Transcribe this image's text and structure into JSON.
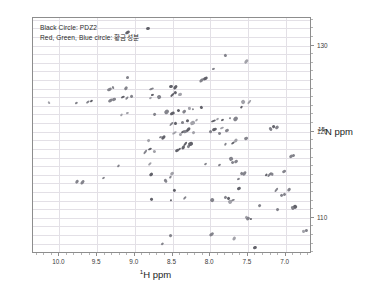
{
  "figure": {
    "width": 366,
    "height": 292,
    "background": "#ffffff",
    "frame_color": "#8d8d8d",
    "grid_color": "#e3e0e6",
    "peak_color": "#7a7a82"
  },
  "legend": {
    "line1": "Black Circle: PDZ2",
    "line2": "Red, Green, Blue circle: 황금성분"
  },
  "axes": {
    "x_title_sup": "1",
    "x_title_main": "H ppm",
    "y_title_sup": "15",
    "y_title_main": "N ppm",
    "x_ticks": [
      "10.0",
      "9.5",
      "9.0",
      "8.5",
      "8.0",
      "7.5",
      "7.0"
    ],
    "x_tick_values": [
      10.0,
      9.5,
      9.0,
      8.5,
      8.0,
      7.5,
      7.0
    ],
    "y_ticks": [
      "110",
      "120",
      "130"
    ],
    "y_tick_values": [
      110,
      120,
      130
    ]
  },
  "chart_data": {
    "type": "scatter",
    "title": "",
    "subtitle": "",
    "xlabel": "1H ppm",
    "ylabel": "15N ppm",
    "xlim": [
      10.35,
      6.65
    ],
    "ylim": [
      133.2,
      105.8
    ],
    "x_inverted": true,
    "y_inverted": true,
    "grid": true,
    "legend_position": "top-left",
    "annotations": [
      "Black Circle: PDZ2",
      "Red, Green, Blue circle: 황금성분"
    ],
    "series": [
      {
        "name": "PDZ2 HSQC cross-peaks",
        "color": "#7a7a82",
        "points": [
          [
            7.4,
            106.5
          ],
          [
            8.64,
            107.0
          ],
          [
            8.52,
            108.0
          ],
          [
            7.68,
            107.6
          ],
          [
            7.98,
            108.1
          ],
          [
            6.77,
            108.4
          ],
          [
            6.72,
            108.5
          ],
          [
            7.52,
            110.0
          ],
          [
            7.46,
            109.8
          ],
          [
            7.49,
            109.9
          ],
          [
            7.1,
            111.0
          ],
          [
            6.88,
            111.3
          ],
          [
            6.91,
            111.2
          ],
          [
            7.35,
            111.4
          ],
          [
            7.7,
            112.0
          ],
          [
            7.74,
            111.9
          ],
          [
            8.78,
            112.2
          ],
          [
            8.52,
            112.0
          ],
          [
            8.34,
            112.3
          ],
          [
            7.98,
            112.1
          ],
          [
            7.8,
            112.4
          ],
          [
            7.76,
            112.3
          ],
          [
            7.05,
            112.6
          ],
          [
            7.01,
            112.7
          ],
          [
            6.95,
            113.3
          ],
          [
            8.48,
            113.2
          ],
          [
            7.62,
            113.4
          ],
          [
            7.12,
            113.2
          ],
          [
            9.76,
            114.2
          ],
          [
            9.7,
            114.1
          ],
          [
            9.41,
            114.6
          ],
          [
            8.6,
            114.3
          ],
          [
            8.53,
            114.7
          ],
          [
            8.78,
            115.0
          ],
          [
            8.5,
            115.2
          ],
          [
            7.58,
            115.2
          ],
          [
            7.55,
            115.1
          ],
          [
            7.25,
            114.9
          ],
          [
            7.22,
            115.0
          ],
          [
            7.18,
            115.1
          ],
          [
            7.62,
            114.5
          ],
          [
            7.02,
            115.4
          ],
          [
            9.22,
            116.0
          ],
          [
            8.8,
            116.2
          ],
          [
            8.06,
            116.3
          ],
          [
            7.88,
            116.1
          ],
          [
            7.7,
            116.4
          ],
          [
            7.66,
            116.5
          ],
          [
            7.73,
            116.8
          ],
          [
            6.89,
            117.2
          ],
          [
            6.93,
            117.1
          ],
          [
            8.86,
            117.6
          ],
          [
            8.74,
            117.7
          ],
          [
            8.8,
            118.0
          ],
          [
            8.44,
            117.8
          ],
          [
            8.4,
            118.0
          ],
          [
            8.36,
            118.2
          ],
          [
            8.33,
            118.5
          ],
          [
            8.29,
            118.3
          ],
          [
            8.26,
            118.6
          ],
          [
            7.8,
            118.5
          ],
          [
            7.7,
            118.7
          ],
          [
            7.66,
            118.9
          ],
          [
            7.52,
            119.2
          ],
          [
            8.82,
            119.0
          ],
          [
            8.66,
            119.4
          ],
          [
            8.62,
            119.3
          ],
          [
            8.48,
            119.8
          ],
          [
            8.4,
            119.6
          ],
          [
            8.36,
            119.9
          ],
          [
            8.33,
            120.0
          ],
          [
            8.29,
            120.2
          ],
          [
            8.22,
            119.9
          ],
          [
            7.99,
            120.0
          ],
          [
            7.95,
            120.2
          ],
          [
            7.88,
            119.8
          ],
          [
            7.84,
            120.4
          ],
          [
            7.78,
            120.1
          ],
          [
            7.2,
            120.3
          ],
          [
            7.16,
            120.6
          ],
          [
            7.12,
            120.5
          ],
          [
            8.52,
            120.9
          ],
          [
            8.46,
            121.0
          ],
          [
            8.36,
            121.1
          ],
          [
            8.3,
            121.3
          ],
          [
            8.24,
            121.0
          ],
          [
            8.18,
            121.4
          ],
          [
            7.96,
            121.2
          ],
          [
            7.9,
            121.5
          ],
          [
            7.84,
            121.3
          ],
          [
            7.74,
            121.6
          ],
          [
            7.66,
            121.5
          ],
          [
            9.18,
            121.9
          ],
          [
            9.1,
            122.2
          ],
          [
            8.74,
            122.0
          ],
          [
            8.58,
            122.3
          ],
          [
            8.5,
            122.1
          ],
          [
            8.42,
            122.5
          ],
          [
            8.34,
            122.4
          ],
          [
            8.28,
            122.7
          ],
          [
            8.22,
            122.6
          ],
          [
            8.12,
            122.8
          ],
          [
            7.58,
            122.9
          ],
          [
            10.13,
            123.4
          ],
          [
            9.78,
            123.3
          ],
          [
            9.62,
            123.4
          ],
          [
            9.58,
            123.5
          ],
          [
            9.32,
            123.6
          ],
          [
            9.28,
            123.8
          ],
          [
            9.16,
            124.0
          ],
          [
            9.1,
            123.9
          ],
          [
            9.04,
            124.1
          ],
          [
            8.8,
            123.9
          ],
          [
            8.76,
            124.2
          ],
          [
            8.68,
            124.0
          ],
          [
            8.5,
            124.2
          ],
          [
            8.46,
            124.5
          ],
          [
            8.4,
            124.3
          ],
          [
            7.56,
            123.5
          ],
          [
            7.48,
            123.4
          ],
          [
            9.34,
            124.9
          ],
          [
            9.28,
            125.1
          ],
          [
            9.12,
            125.0
          ],
          [
            8.78,
            124.9
          ],
          [
            8.52,
            125.2
          ],
          [
            8.46,
            125.1
          ],
          [
            9.1,
            126.3
          ],
          [
            8.12,
            126.0
          ],
          [
            8.06,
            126.1
          ],
          [
            7.96,
            127.3
          ],
          [
            7.8,
            128.8
          ],
          [
            7.52,
            128.1
          ],
          [
            9.1,
            131.5
          ],
          [
            8.82,
            132.0
          ]
        ]
      }
    ]
  }
}
